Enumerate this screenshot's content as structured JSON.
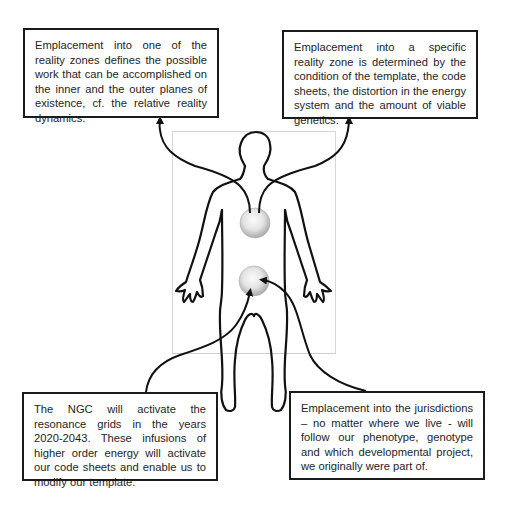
{
  "diagram": {
    "type": "annotated-body-figure",
    "figure": {
      "label": "human-body-outline",
      "nodes": [
        {
          "id": "upper-sphere",
          "location": "chest"
        },
        {
          "id": "lower-sphere",
          "location": "pelvis"
        }
      ],
      "edges": [
        {
          "from": "upper-sphere",
          "to": "box-top-left"
        },
        {
          "from": "upper-sphere",
          "to": "box-top-right"
        },
        {
          "from": "box-bottom-left",
          "to": "lower-sphere"
        },
        {
          "from": "box-bottom-right",
          "to": "lower-sphere"
        }
      ]
    },
    "boxes": {
      "top_left": "Emplacement into one of the reality zones defines the possible work that can be accomplished on the inner and the outer planes of existence, cf. the relative reality dynamics.",
      "top_right": "Emplacement into a specific reality zone is determined by the condition of the template, the code sheets, the distortion in the energy system and the amount of viable genetics.",
      "bottom_left": "The NGC will activate the resonance grids in the years 2020-2043. These infusions of higher order energy will activate our code sheets and enable us to modify our template.",
      "bottom_right": "Emplacement into the jurisdictions – no matter where we live - will follow our phenotype, genotype and which developmental project, we originally were part of."
    },
    "colors": {
      "line": "#111111",
      "box_border": "#1a1a1a",
      "sphere_light": "#f7f7f7",
      "sphere_dark": "#a9a9a9",
      "frame": "#d6d6d6"
    }
  }
}
